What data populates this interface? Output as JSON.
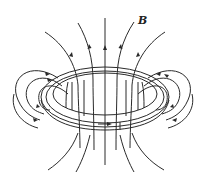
{
  "figure": {
    "field_label": "B",
    "colors": {
      "stroke": "#2a2a2a",
      "background": "#ffffff"
    },
    "elements": {
      "ring": "current-carrying loop (ring)",
      "current_arrow": "current direction arrow (pointing right on front of ring)",
      "field_lines": "magnetic field lines with direction arrows, upward through loop center, looping around the wire on each side"
    }
  }
}
